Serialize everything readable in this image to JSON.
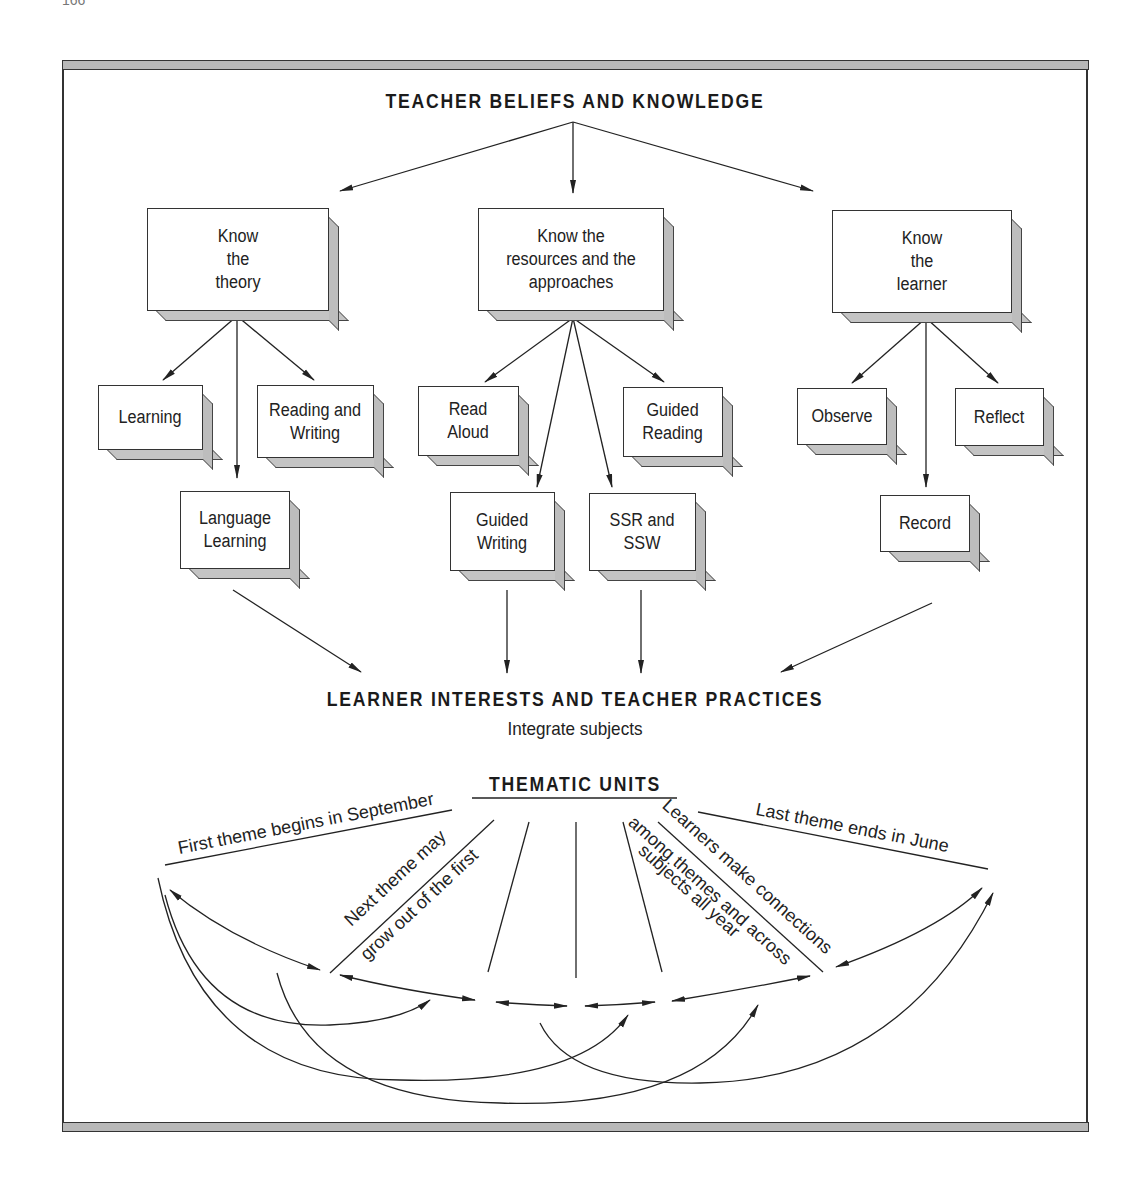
{
  "page": {
    "number": "166"
  },
  "top": {
    "title": "TEACHER BELIEFS AND KNOWLEDGE"
  },
  "branches": [
    {
      "label": "Know\nthe\ntheory",
      "children": [
        "Learning",
        "Reading and\nWriting",
        "Language\nLearning"
      ]
    },
    {
      "label": "Know the\nresources and the\napproaches",
      "children": [
        "Read\nAloud",
        "Guided\nReading",
        "Guided\nWriting",
        "SSR and\nSSW"
      ]
    },
    {
      "label": "Know\nthe\nlearner",
      "children": [
        "Observe",
        "Reflect",
        "Record"
      ]
    }
  ],
  "middle": {
    "title": "LEARNER INTERESTS AND TEACHER PRACTICES",
    "subtitle": "Integrate subjects"
  },
  "thematic": {
    "title": "THEMATIC UNITS",
    "annotations": {
      "first": "First theme begins in September",
      "next_1": "Next theme may",
      "next_2": "grow out of the first",
      "connect_1": "Learners make connections",
      "connect_2": "among themes and across",
      "connect_3": "subjects all year",
      "last": "Last theme ends in June"
    }
  },
  "colors": {
    "line": "#222222",
    "shade": "#bdbdbd",
    "background": "#ffffff"
  }
}
